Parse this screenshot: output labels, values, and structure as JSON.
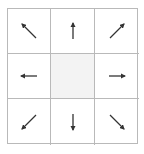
{
  "grid": {
    "cells": [
      {
        "position": "top-left",
        "icon": "arrow-up-left-icon",
        "angle": 135
      },
      {
        "position": "top",
        "icon": "arrow-up-icon",
        "angle": 90
      },
      {
        "position": "top-right",
        "icon": "arrow-up-right-icon",
        "angle": 45
      },
      {
        "position": "left",
        "icon": "arrow-left-icon",
        "angle": 180
      },
      {
        "position": "center",
        "icon": null,
        "fill": "#f3f3f3"
      },
      {
        "position": "right",
        "icon": "arrow-right-icon",
        "angle": 0
      },
      {
        "position": "bottom-left",
        "icon": "arrow-down-left-icon",
        "angle": 225
      },
      {
        "position": "bottom",
        "icon": "arrow-down-icon",
        "angle": 270
      },
      {
        "position": "bottom-right",
        "icon": "arrow-down-right-icon",
        "angle": 315
      }
    ],
    "border_color": "#b9b9b9",
    "arrow_color": "#333333"
  }
}
